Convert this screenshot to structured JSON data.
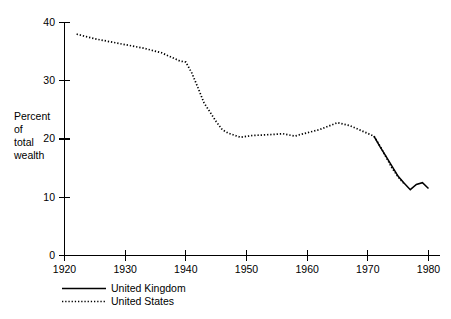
{
  "chart_data": {
    "type": "line",
    "title": "",
    "xlabel": "",
    "ylabel": "Percent of total wealth",
    "ylabel_lines": [
      "Percent",
      "of",
      "total",
      "wealth"
    ],
    "xlim": [
      1920,
      1980
    ],
    "ylim": [
      0,
      40
    ],
    "xticks": [
      1920,
      1930,
      1940,
      1950,
      1960,
      1970,
      1980
    ],
    "xtick_labels": [
      "1920",
      "1930",
      "1940",
      "1950",
      "1960",
      "1970",
      "1980"
    ],
    "yticks": [
      0,
      10,
      20,
      30,
      40
    ],
    "ytick_labels": [
      "0",
      "10",
      "20",
      "30",
      "40"
    ],
    "grid": false,
    "legend_position": "below-left",
    "series": [
      {
        "name": "United Kingdom",
        "style": "solid",
        "color": "#000000",
        "x": [
          1971,
          1972,
          1973,
          1974,
          1975,
          1976,
          1977,
          1978,
          1979,
          1980
        ],
        "values": [
          20.5,
          18.7,
          17.0,
          15.3,
          13.6,
          12.4,
          11.3,
          12.2,
          12.5,
          11.5
        ]
      },
      {
        "name": "United States",
        "style": "dotted",
        "color": "#000000",
        "x": [
          1922,
          1925,
          1929,
          1933,
          1936,
          1939,
          1940,
          1941,
          1942,
          1943,
          1945,
          1946,
          1947,
          1949,
          1951,
          1953,
          1956,
          1958,
          1959,
          1962,
          1965,
          1967,
          1969,
          1971,
          1972,
          1973,
          1974,
          1975,
          1976
        ],
        "values": [
          38.0,
          37.2,
          36.4,
          35.6,
          34.8,
          33.4,
          33.2,
          31.3,
          28.8,
          26.2,
          23.0,
          21.6,
          21.0,
          20.3,
          20.6,
          20.7,
          20.9,
          20.5,
          20.8,
          21.6,
          22.8,
          22.3,
          21.4,
          20.5,
          18.8,
          16.9,
          15.0,
          13.5,
          12.3
        ]
      }
    ]
  },
  "legend": {
    "items": [
      {
        "label": "United Kingdom",
        "style": "solid"
      },
      {
        "label": "United States",
        "style": "dotted"
      }
    ]
  }
}
